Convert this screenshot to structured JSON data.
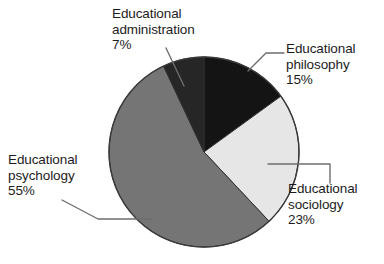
{
  "chart_data": {
    "type": "pie",
    "title": "",
    "subtitle": "",
    "xlabel": "",
    "ylabel": "",
    "legend_position": "none",
    "grid": false,
    "start_angle_deg": 0,
    "direction": "clockwise",
    "units": "percent",
    "categories": [
      "Educational philosophy",
      "Educational sociology",
      "Educational psychology",
      "Educational administration"
    ],
    "values": [
      15,
      23,
      55,
      7
    ],
    "slices": [
      {
        "name": "Educational philosophy",
        "label_line1": "Educational",
        "label_line2": "philosophy",
        "value": 15,
        "percent_text": "15%",
        "color": "#141414"
      },
      {
        "name": "Educational sociology",
        "label_line1": "Educational",
        "label_line2": "sociology",
        "value": 23,
        "percent_text": "23%",
        "color": "#e6e6e6"
      },
      {
        "name": "Educational psychology",
        "label_line1": "Educational",
        "label_line2": "psychology",
        "value": 55,
        "percent_text": "55%",
        "color": "#757575"
      },
      {
        "name": "Educational administration",
        "label_line1": "Educational",
        "label_line2": "administration",
        "value": 7,
        "percent_text": "7%",
        "color": "#262626"
      }
    ]
  },
  "figure": {
    "background_color": "#ffffff",
    "outline_color": "#3a3a3a",
    "leader_line_color": "#6e6e6e",
    "text_color": "#1c1c1c"
  }
}
